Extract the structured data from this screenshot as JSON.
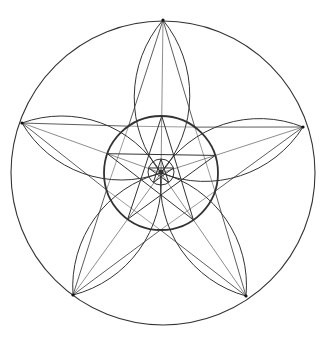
{
  "figure": {
    "stroke_color": "#333333",
    "background": "#ffffff",
    "outer_circle": {
      "cx": 163,
      "cy": 173,
      "r": 152
    },
    "inner_circle": {
      "cx": 161,
      "cy": 173,
      "r": 57
    },
    "center_circle": {
      "cx": 161,
      "cy": 172,
      "r": 13
    },
    "outer_points": [
      [
        163,
        20
      ],
      [
        303,
        127
      ],
      [
        246,
        296
      ],
      [
        73,
        295
      ],
      [
        22,
        123
      ]
    ]
  }
}
